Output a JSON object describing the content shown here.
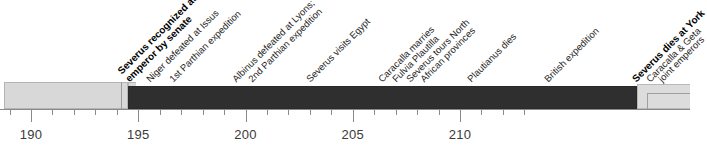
{
  "chart_data": {
    "type": "timeline",
    "title": "",
    "xlabel": "",
    "ylabel": "",
    "xlim": [
      189.5,
      212.3
    ],
    "grid": false,
    "legend": "none",
    "tick_labels": [
      "190",
      "195",
      "200",
      "205",
      "210"
    ],
    "major_ticks": [
      190,
      195,
      200,
      205,
      210
    ],
    "minor_tick_step": 1,
    "bars": [
      {
        "name": "pre-reign",
        "start": 189.5,
        "end": 195.3,
        "color": "#d8d8d8",
        "label": ""
      },
      {
        "name": "reign-of-severus",
        "start": 193.5,
        "end": 211.4,
        "color": "#2f2f2f",
        "label": ""
      },
      {
        "name": "successors",
        "start": 211.4,
        "end": 212.3,
        "color": "#dcdcdc",
        "label": ""
      }
    ],
    "events": [
      {
        "year": 193,
        "label": "Severus recognized as",
        "label2": "emperor by senate",
        "bold": true,
        "x": 131
      },
      {
        "year": 194,
        "label": "Niger defeated at Issus",
        "label2": "",
        "bold": false,
        "x": 152
      },
      {
        "year": 195,
        "label": "1st Parthian expedition",
        "label2": "",
        "bold": false,
        "x": 175
      },
      {
        "year": 197,
        "label": "Albinus defeated at Lyons;",
        "label2": "",
        "bold": false,
        "x": 238
      },
      {
        "year": 197,
        "label": "2nd Parthian expedition",
        "label2": "",
        "bold": false,
        "x": 254
      },
      {
        "year": 199,
        "label": "Severus visits Egypt",
        "label2": "",
        "bold": false,
        "x": 312
      },
      {
        "year": 202,
        "label": "Caracalla marries",
        "label2": "",
        "bold": false,
        "x": 384
      },
      {
        "year": 202,
        "label": "Fulvia Plautilla",
        "label2": "",
        "bold": false,
        "x": 398
      },
      {
        "year": 203,
        "label": "Severus tours North",
        "label2": "",
        "bold": false,
        "x": 412
      },
      {
        "year": 203,
        "label": "African provinces",
        "label2": "",
        "bold": false,
        "x": 426
      },
      {
        "year": 205,
        "label": "Plautianus dies",
        "label2": "",
        "bold": false,
        "x": 473
      },
      {
        "year": 208,
        "label": "British expedition",
        "label2": "",
        "bold": false,
        "x": 550
      },
      {
        "year": 211,
        "label": "Severus dies at York",
        "label2": "",
        "bold": true,
        "x": 638
      },
      {
        "year": 211,
        "label": "Caracalla & Geta",
        "label2": "",
        "bold": false,
        "x": 652
      },
      {
        "year": 211,
        "label": "joint emperors",
        "label2": "",
        "bold": false,
        "x": 664
      }
    ]
  }
}
